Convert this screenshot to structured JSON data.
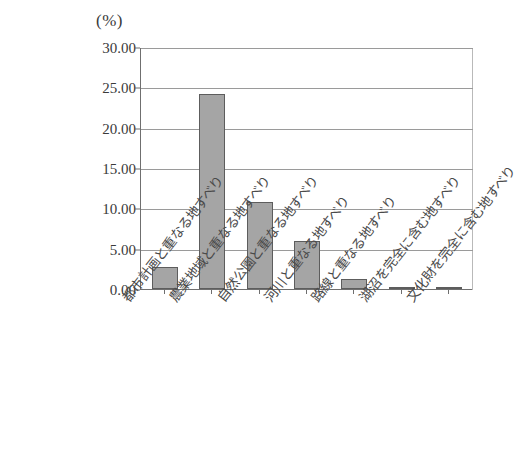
{
  "chart_data": {
    "type": "bar",
    "title": "",
    "subtitle": "",
    "xlabel": "",
    "ylabel": "",
    "unit_label": "(%)",
    "ylim": [
      0,
      30
    ],
    "ytick_step": 5,
    "ytick_labels": [
      "0.00",
      "5.00",
      "10.00",
      "15.00",
      "20.00",
      "25.00",
      "30.00"
    ],
    "ytick_values": [
      0,
      5,
      10,
      15,
      20,
      25,
      30
    ],
    "grid": true,
    "legend": false,
    "legend_position": "none",
    "bar_color": "#a5a5a5",
    "bar_edge_color": "#5d5d5d",
    "axis_color": "#6f6f6f",
    "grid_color": "#9a9a9a",
    "categories": [
      "都市計画と重なる地すべり",
      "農業地域と重なる地すべり",
      "自然公園と重なる地すべり",
      "河川と重なる地すべり",
      "路線と重なる地すべり",
      "湖沼を完全に含む地すべり",
      "文化財を完全に含む地すべり"
    ],
    "values": [
      2.7,
      24.2,
      10.8,
      6.0,
      1.2,
      0.2,
      0.25
    ]
  }
}
